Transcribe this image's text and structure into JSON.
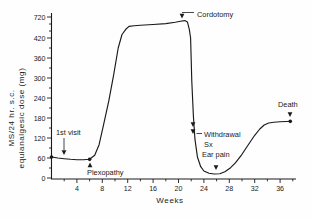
{
  "figure": {
    "y_axis_title_line1": "MS/24 hr. s.c.",
    "y_axis_title_line2": "equianalgesic dose (mg)"
  },
  "chart_data": {
    "type": "line",
    "title": "",
    "xlabel": "Weeks",
    "ylabel": "MS/24 hr. s.c. equianalgesic dose (mg)",
    "xlim": [
      0,
      38.5
    ],
    "ylim": [
      0,
      720
    ],
    "y_axis_break": {
      "between": [
        420,
        720
      ],
      "note": "compressed scale above 420"
    },
    "grid": false,
    "legend": "none",
    "x_ticks": [
      4,
      8,
      12,
      16,
      20,
      24,
      28,
      32,
      36
    ],
    "x_minor_ticks": [
      2,
      6,
      10,
      14,
      18,
      22,
      26,
      30,
      34,
      38
    ],
    "y_ticks": [
      720,
      420,
      360,
      300,
      240,
      180,
      120,
      60,
      0
    ],
    "y_minor_ticks": [
      30,
      90,
      150,
      210,
      270,
      330,
      390,
      520,
      620
    ],
    "series": [
      {
        "name": "MS equianalgesic dose",
        "points": [
          [
            0,
            63
          ],
          [
            1,
            60
          ],
          [
            2,
            58
          ],
          [
            3,
            56
          ],
          [
            4,
            55
          ],
          [
            5,
            55
          ],
          [
            6,
            56
          ],
          [
            6.8,
            68
          ],
          [
            7.5,
            100
          ],
          [
            8.2,
            160
          ],
          [
            9,
            230
          ],
          [
            9.8,
            310
          ],
          [
            10.5,
            390
          ],
          [
            11.1,
            470
          ],
          [
            11.7,
            545
          ],
          [
            12.2,
            585
          ],
          [
            13,
            595
          ],
          [
            14,
            601
          ],
          [
            16,
            613
          ],
          [
            18,
            626
          ],
          [
            19.5,
            645
          ],
          [
            20.3,
            660
          ],
          [
            21,
            668
          ],
          [
            21.4,
            650
          ],
          [
            21.7,
            545
          ],
          [
            21.9,
            420
          ],
          [
            22.1,
            290
          ],
          [
            22.35,
            185
          ],
          [
            22.6,
            115
          ],
          [
            23,
            62
          ],
          [
            23.5,
            34
          ],
          [
            24,
            21
          ],
          [
            24.8,
            14
          ],
          [
            25.6,
            12
          ],
          [
            26.5,
            13
          ],
          [
            27.3,
            19
          ],
          [
            28.2,
            31
          ],
          [
            29,
            46
          ],
          [
            30,
            71
          ],
          [
            31,
            100
          ],
          [
            32,
            128
          ],
          [
            32.8,
            147
          ],
          [
            33.5,
            159
          ],
          [
            34.2,
            165
          ],
          [
            35,
            167
          ],
          [
            36,
            168.5
          ],
          [
            37,
            169.5
          ],
          [
            37.6,
            170
          ]
        ]
      }
    ],
    "markers": [
      {
        "name": "first-visit-point",
        "week": 0,
        "dose": 63
      },
      {
        "name": "plexopathy-point",
        "week": 6,
        "dose": 56
      },
      {
        "name": "death-point",
        "week": 37.6,
        "dose": 170
      }
    ],
    "annotations": [
      {
        "id": "first-visit",
        "label": "1st visit",
        "week": 2,
        "dose": 60,
        "dir": "down",
        "tip": [
          64,
          155
        ],
        "leader": [
          [
            64,
            138
          ],
          [
            64,
            150
          ]
        ]
      },
      {
        "id": "plexopathy",
        "label": "Plexopathy",
        "week": 6,
        "dose": 56,
        "dir": "up",
        "tip": [
          90,
          162.5
        ]
      },
      {
        "id": "cordotomy",
        "label": "Cordotomy",
        "week": 20.5,
        "dose": 668,
        "dir": "down",
        "tip": [
          182,
          18.5
        ],
        "leader": [
          [
            194,
            12.5
          ],
          [
            182,
            12.5
          ]
        ]
      },
      {
        "id": "withdrawal-sx",
        "label": "Withdrawal",
        "label2": "Sx",
        "week": 22.3,
        "dose": 150,
        "dir": "down",
        "arrows": [
          [
            193,
            127
          ],
          [
            193,
            134
          ]
        ],
        "leader": [
          [
            202,
            133.5
          ],
          [
            196.5,
            133.5
          ]
        ]
      },
      {
        "id": "ear-pain",
        "label": "Ear pain",
        "week": 26,
        "dose": 15,
        "dir": "down",
        "tip": [
          216,
          170
        ]
      },
      {
        "id": "death",
        "label": "Death",
        "week": 37.6,
        "dose": 180,
        "dir": "down",
        "tip": [
          290,
          117
        ]
      }
    ],
    "colors": {
      "line": "#1a1a1a",
      "background": "#fefefe"
    }
  }
}
